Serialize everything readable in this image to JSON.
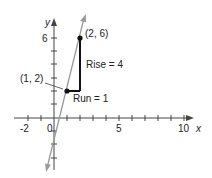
{
  "diagram": {
    "type": "slope-of-line",
    "x_axis": {
      "label": "x",
      "tick_labels": [
        "-2",
        "0",
        "5",
        "10"
      ],
      "range": [
        -3,
        11
      ]
    },
    "y_axis": {
      "label": "y",
      "tick_labels": [
        "6"
      ],
      "range": [
        -6,
        7
      ]
    },
    "points": [
      {
        "label": "(1, 2)",
        "x": 1,
        "y": 2
      },
      {
        "label": "(2, 6)",
        "x": 2,
        "y": 6
      }
    ],
    "annotations": {
      "rise": "Rise = 4",
      "run": "Run = 1"
    },
    "line": {
      "slope": 4,
      "intercept": -2,
      "color": "#9a9a9a"
    },
    "triangle_color": "#111111"
  }
}
